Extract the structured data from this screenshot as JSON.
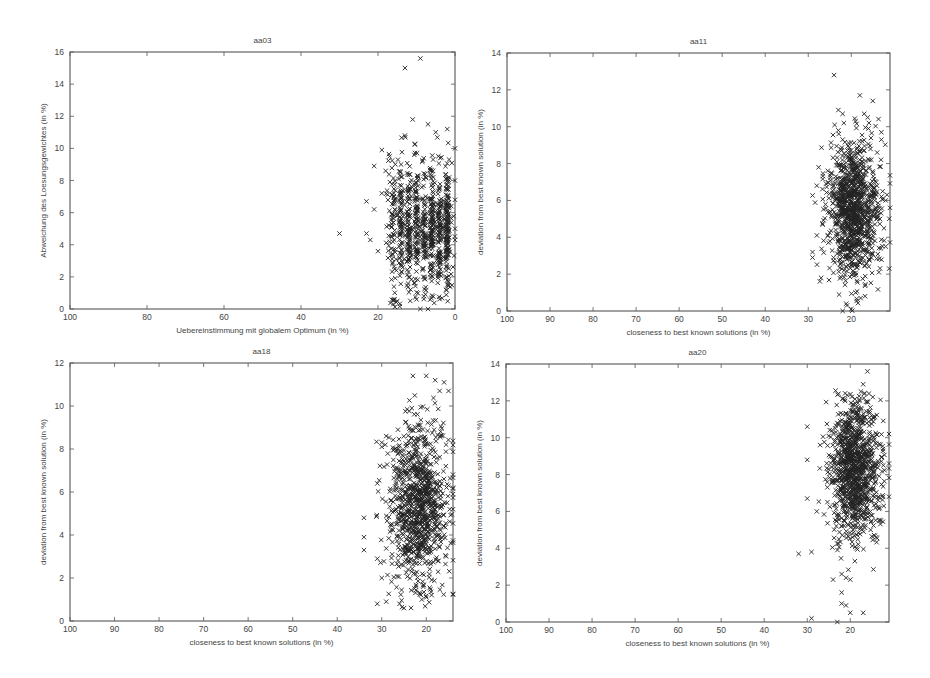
{
  "chart_data": [
    {
      "type": "scatter",
      "title": "aa03",
      "xlabel": "Uebereinstimmung mit globalem Optimum (in %)",
      "ylabel": "Abweichung des Loesungsgewichtes (in %)",
      "xlim": [
        100,
        0
      ],
      "ylim": [
        0,
        16
      ],
      "xticks": [
        100,
        80,
        60,
        40,
        20,
        0
      ],
      "yticks": [
        0,
        2,
        4,
        6,
        8,
        10,
        12,
        14,
        16
      ],
      "grid": false,
      "legend": null,
      "marker": "x",
      "frame": {
        "left": 70,
        "top": 52,
        "right": 455,
        "bottom": 309
      },
      "cluster": {
        "n": 900,
        "x_columns": [
          2,
          4,
          6,
          8,
          10,
          12,
          14,
          16
        ],
        "x_jitter": 0.5,
        "x_min": 0,
        "x_max": 20,
        "y_mean": 5.0,
        "y_sd": 2.1,
        "y_min": 0,
        "y_max": 11.5,
        "seed": 3
      },
      "points": [
        [
          9,
          15.6
        ],
        [
          13,
          15.0
        ],
        [
          11,
          11.8
        ],
        [
          30,
          4.7
        ],
        [
          23,
          6.7
        ],
        [
          23,
          4.7
        ],
        [
          22,
          4.3
        ],
        [
          21,
          6.2
        ],
        [
          21,
          8.9
        ],
        [
          19,
          9.9
        ],
        [
          19,
          7.2
        ],
        [
          20,
          3.6
        ],
        [
          0,
          10.0
        ],
        [
          0,
          8.0
        ],
        [
          0,
          5.0
        ],
        [
          0,
          4.3
        ],
        [
          0,
          6.8
        ],
        [
          2,
          11.2
        ],
        [
          2,
          2.6
        ],
        [
          16,
          0.3
        ],
        [
          9,
          0.0
        ],
        [
          7,
          0.0
        ],
        [
          15,
          0.5
        ],
        [
          10,
          0.6
        ],
        [
          17,
          9.5
        ],
        [
          18,
          8.6
        ],
        [
          14,
          9.0
        ],
        [
          13,
          10.8
        ],
        [
          7,
          11.5
        ],
        [
          5,
          11.0
        ]
      ]
    },
    {
      "type": "scatter",
      "title": "aa11",
      "xlabel": "closeness to best known solutions (in %)",
      "ylabel": "deviation from best known solution (in %)",
      "xlim": [
        100,
        11
      ],
      "ylim": [
        0,
        14
      ],
      "xticks": [
        100,
        90,
        80,
        70,
        60,
        50,
        40,
        30,
        20
      ],
      "yticks": [
        0,
        2,
        4,
        6,
        8,
        10,
        12,
        14
      ],
      "grid": false,
      "legend": null,
      "marker": "x",
      "frame": {
        "left": 507,
        "top": 53,
        "right": 890,
        "bottom": 311
      },
      "cluster": {
        "n": 1100,
        "x_mean": 19.5,
        "x_sd": 3.0,
        "x_min": 11,
        "x_max": 29,
        "y_mean": 5.5,
        "y_sd": 1.9,
        "y_min": 0,
        "y_max": 11,
        "seed": 11
      },
      "points": [
        [
          24,
          12.8
        ],
        [
          18,
          11.7
        ],
        [
          15,
          11.4
        ],
        [
          22,
          10.7
        ],
        [
          17,
          10.7
        ],
        [
          19,
          10.3
        ],
        [
          29,
          2.9
        ],
        [
          28,
          4.1
        ],
        [
          28,
          6.8
        ],
        [
          27,
          1.8
        ],
        [
          21,
          0.3
        ],
        [
          20,
          0.1
        ],
        [
          22,
          0.0
        ],
        [
          19,
          1.0
        ],
        [
          11,
          5.6
        ],
        [
          12,
          6.0
        ],
        [
          12,
          3.5
        ],
        [
          13,
          9.7
        ],
        [
          13,
          9.3
        ],
        [
          16,
          9.9
        ],
        [
          22,
          9.3
        ],
        [
          23,
          9.8
        ]
      ]
    },
    {
      "type": "scatter",
      "title": "aa18",
      "xlabel": "closeness to best known solutions (in %)",
      "ylabel": "deviation from best known solution (in %)",
      "xlim": [
        100,
        14
      ],
      "ylim": [
        0,
        12
      ],
      "xticks": [
        100,
        90,
        80,
        70,
        60,
        50,
        40,
        30,
        20
      ],
      "yticks": [
        0,
        2,
        4,
        6,
        8,
        10,
        12
      ],
      "grid": false,
      "legend": null,
      "marker": "x",
      "frame": {
        "left": 70,
        "top": 363,
        "right": 453,
        "bottom": 621
      },
      "cluster": {
        "n": 1000,
        "x_mean": 22,
        "x_sd": 3.2,
        "x_min": 14,
        "x_max": 32,
        "y_mean": 5.4,
        "y_sd": 1.9,
        "y_min": 0.6,
        "y_max": 10.5,
        "seed": 18
      },
      "points": [
        [
          34,
          4.8
        ],
        [
          34,
          3.9
        ],
        [
          34,
          3.3
        ],
        [
          31,
          6.4
        ],
        [
          31,
          2.9
        ],
        [
          31,
          0.8
        ],
        [
          30,
          8.1
        ],
        [
          30,
          8.3
        ],
        [
          29,
          8.6
        ],
        [
          29,
          0.9
        ],
        [
          26,
          0.8
        ],
        [
          25,
          0.6
        ],
        [
          23,
          11.4
        ],
        [
          20,
          11.4
        ],
        [
          18,
          11.2
        ],
        [
          16,
          11.1
        ],
        [
          17,
          10.7
        ],
        [
          15,
          10.7
        ],
        [
          14,
          5.2
        ],
        [
          14,
          5.9
        ],
        [
          14,
          6.2
        ],
        [
          20,
          1.1
        ],
        [
          21,
          1.0
        ],
        [
          30,
          2.0
        ]
      ]
    },
    {
      "type": "scatter",
      "title": "aa20",
      "xlabel": "closeness to best known solutions (in %)",
      "ylabel": "deviation from best known solution (in %)",
      "xlim": [
        100,
        11
      ],
      "ylim": [
        0,
        14
      ],
      "xticks": [
        100,
        90,
        80,
        70,
        60,
        50,
        40,
        30,
        20
      ],
      "yticks": [
        0,
        2,
        4,
        6,
        8,
        10,
        12,
        14
      ],
      "grid": false,
      "legend": null,
      "marker": "x",
      "frame": {
        "left": 506,
        "top": 364,
        "right": 889,
        "bottom": 622
      },
      "cluster": {
        "n": 1100,
        "x_mean": 19,
        "x_sd": 2.9,
        "x_min": 11,
        "x_max": 28,
        "y_mean": 8.3,
        "y_sd": 2.0,
        "y_min": 2.8,
        "y_max": 12.6,
        "seed": 20
      },
      "points": [
        [
          16,
          13.6
        ],
        [
          17,
          12.9
        ],
        [
          30,
          10.6
        ],
        [
          30,
          8.8
        ],
        [
          32,
          3.7
        ],
        [
          29,
          3.8
        ],
        [
          29,
          0.2
        ],
        [
          23,
          0.0
        ],
        [
          22,
          1.0
        ],
        [
          21,
          0.9
        ],
        [
          20,
          0.5
        ],
        [
          17,
          0.5
        ],
        [
          22,
          1.6
        ],
        [
          24,
          2.3
        ],
        [
          21,
          2.4
        ],
        [
          20,
          2.3
        ],
        [
          22,
          2.6
        ],
        [
          11,
          10.2
        ],
        [
          11,
          8.6
        ],
        [
          11,
          6.8
        ],
        [
          30,
          6.7
        ],
        [
          27,
          9.6
        ]
      ]
    }
  ]
}
